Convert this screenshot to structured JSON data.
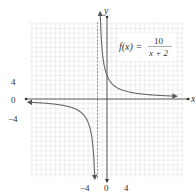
{
  "chart_data": {
    "type": "line",
    "function": "10/(x+2)",
    "equation_label": {
      "lhs": "f(x) =",
      "numerator": "10",
      "denominator": "x + 2"
    },
    "xlabel": "x",
    "ylabel": "y",
    "x_ticks": [
      "-4",
      "0",
      "4"
    ],
    "y_ticks": [
      "4",
      "0",
      "-4"
    ],
    "xlim": [
      -16,
      16
    ],
    "ylim": [
      -16,
      16
    ],
    "grid": true,
    "vertical_asymptote": -2,
    "horizontal_asymptote": 0,
    "branches": [
      {
        "name": "right",
        "x": [
          -1.4,
          -1,
          0,
          2,
          4,
          8,
          12,
          16
        ],
        "y": [
          16.7,
          10,
          5,
          2.5,
          1.67,
          1,
          0.71,
          0.56
        ]
      },
      {
        "name": "left",
        "x": [
          -16,
          -12,
          -8,
          -6,
          -4,
          -3,
          -2.6
        ],
        "y": [
          -0.71,
          -1,
          -1.67,
          -2.5,
          -5,
          -10,
          -16.7
        ]
      }
    ]
  },
  "labels": {
    "x_axis": "x",
    "y_axis": "y",
    "tick_x_neg4": "−4",
    "tick_x_0": "0",
    "tick_x_4": "4",
    "tick_y_4": "4",
    "tick_y_0": "0",
    "tick_y_neg4": "−4",
    "eq_lhs": "f(x) =",
    "eq_num": "10",
    "eq_den": "x + 2"
  },
  "colors": {
    "grid": "#e2e2e2",
    "axis": "#333333",
    "curve": "#666666",
    "asymptote": "#777777"
  }
}
